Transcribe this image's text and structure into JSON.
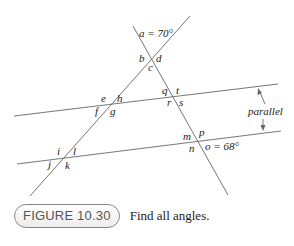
{
  "figure": {
    "number_label": "FIGURE 10.30",
    "caption": "Find all angles.",
    "parallel_label": "parallel",
    "angle_labels": {
      "a": "a = 70°",
      "b": "b",
      "c": "c",
      "d": "d",
      "e": "e",
      "f": "f",
      "g": "g",
      "h": "h",
      "i": "i",
      "j": "j",
      "k": "k",
      "l": "l",
      "m": "m",
      "n": "n",
      "o": "o = 68°",
      "p": "p",
      "q": "q",
      "r": "r",
      "s": "s",
      "t": "t"
    },
    "given": {
      "a": "70°",
      "o": "68°"
    },
    "line_color": "#666666"
  }
}
